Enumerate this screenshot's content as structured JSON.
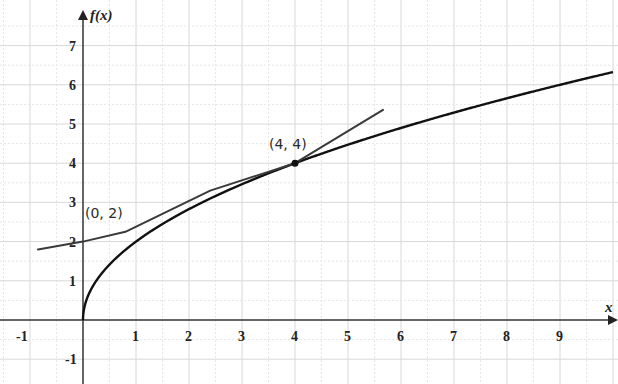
{
  "chart_data": {
    "type": "line",
    "title": "",
    "xlabel": "x",
    "ylabel": "f(x)",
    "xlim": [
      -1.5,
      10.0
    ],
    "ylim": [
      -1.4,
      7.9
    ],
    "x_ticks": [
      -1,
      1,
      2,
      3,
      4,
      5,
      6,
      7,
      8,
      9
    ],
    "y_ticks": [
      -1,
      1,
      2,
      3,
      4,
      5,
      6,
      7
    ],
    "grid": true,
    "legend": null,
    "series": [
      {
        "name": "f(x) = 2√x",
        "style": "curve",
        "color": "#111111",
        "x": [
          0,
          0.05,
          0.25,
          0.5,
          1,
          1.5,
          2,
          3,
          4,
          5,
          6,
          7,
          8,
          9,
          10
        ],
        "y": [
          0,
          0.45,
          1.0,
          1.41,
          2.0,
          2.45,
          2.83,
          3.46,
          4.0,
          4.47,
          4.9,
          5.29,
          5.66,
          6.0,
          6.32
        ]
      },
      {
        "name": "tangent line at (4,4): y = 0.5x + 2",
        "style": "hand-drawn line",
        "color": "#3a3a3a",
        "x": [
          -0.85,
          0,
          0.8,
          2.4,
          4,
          5.66
        ],
        "y": [
          1.8,
          2.0,
          2.25,
          3.3,
          4.0,
          5.36
        ]
      }
    ],
    "annotations": [
      {
        "text": "(0, 2)",
        "x": 0,
        "y": 2
      },
      {
        "text": "(4, 4)",
        "x": 4,
        "y": 4,
        "marker": "dot"
      }
    ]
  }
}
